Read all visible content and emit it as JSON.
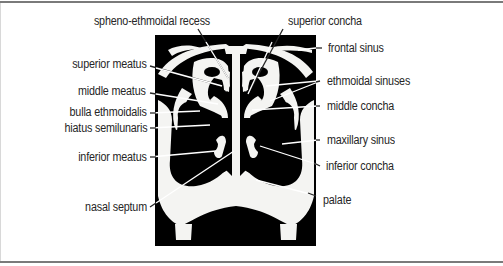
{
  "figure": {
    "colors": {
      "background": "#000000",
      "bone": "#f4f4f2",
      "text": "#262626",
      "leader": "#ffffff",
      "frame": "#7a7a7a"
    }
  },
  "labels": {
    "left": [
      {
        "id": "spheno-ethmoidal-recess",
        "text": "spheno-ethmoidal recess"
      },
      {
        "id": "superior-meatus",
        "text": "superior meatus"
      },
      {
        "id": "middle-meatus",
        "text": "middle meatus"
      },
      {
        "id": "bulla-ethmoidalis",
        "text": "bulla ethmoidalis"
      },
      {
        "id": "hiatus-semilunaris",
        "text": "hiatus semilunaris"
      },
      {
        "id": "inferior-meatus",
        "text": "inferior meatus"
      },
      {
        "id": "nasal-septum",
        "text": "nasal septum"
      }
    ],
    "right": [
      {
        "id": "superior-concha",
        "text": "superior concha"
      },
      {
        "id": "frontal-sinus",
        "text": "frontal sinus"
      },
      {
        "id": "ethmoidal-sinuses",
        "text": "ethmoidal sinuses"
      },
      {
        "id": "middle-concha",
        "text": "middle concha"
      },
      {
        "id": "maxillary-sinus",
        "text": "maxillary sinus"
      },
      {
        "id": "inferior-concha",
        "text": "inferior concha"
      },
      {
        "id": "palate",
        "text": "palate"
      }
    ]
  }
}
